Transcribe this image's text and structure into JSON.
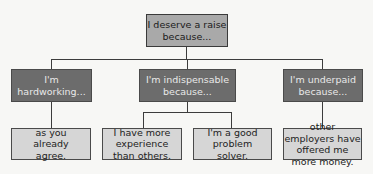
{
  "diagram": {
    "type": "tree",
    "root": {
      "text": "I deserve a raise because...",
      "color": "#a9a9a9"
    },
    "branches": [
      {
        "text": "I'm hardworking...",
        "color": "#6c6c6c",
        "children": [
          {
            "text": "as you already agree."
          }
        ]
      },
      {
        "text": "I'm indispensable because...",
        "color": "#6c6c6c",
        "children": [
          {
            "text": "I have more experience than others."
          },
          {
            "text": "I'm a good problem solver."
          }
        ]
      },
      {
        "text": "I'm underpaid because...",
        "color": "#6c6c6c",
        "children": [
          {
            "text": "other employers have offered me more money."
          }
        ]
      }
    ],
    "leaf_color": "#d6d6d6"
  }
}
